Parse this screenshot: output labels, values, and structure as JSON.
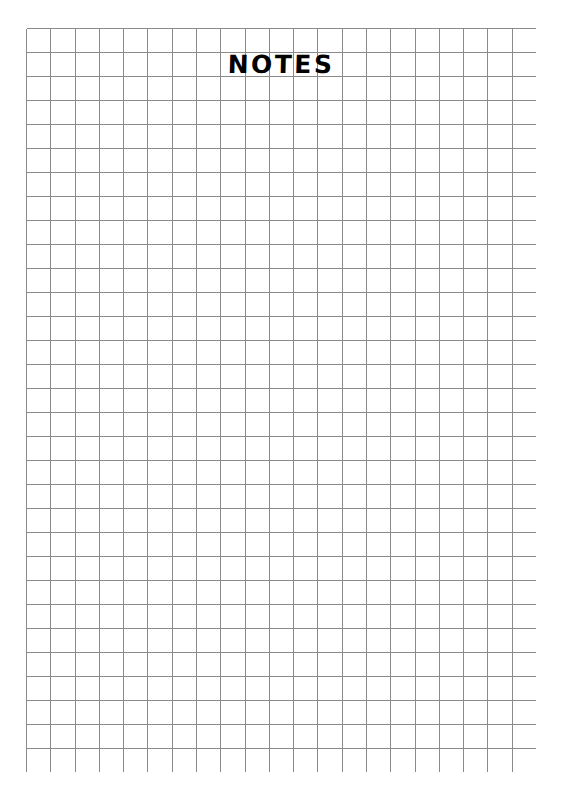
{
  "page": {
    "background_color": "#ffffff",
    "width": 562,
    "height": 801
  },
  "running_head": {
    "folio": "",
    "chapter_title": "",
    "note": "clipped at top edge of page"
  },
  "notes_section": {
    "title": "NOTES",
    "title_color": "#000000"
  },
  "grid": {
    "columns": 21,
    "rows": 31,
    "cell_size_px": 24.3,
    "line_color": "#8a8a8a",
    "line_width_px": 1,
    "left_px": 26,
    "top_px": 28,
    "width_px": 510,
    "height_px": 744
  }
}
